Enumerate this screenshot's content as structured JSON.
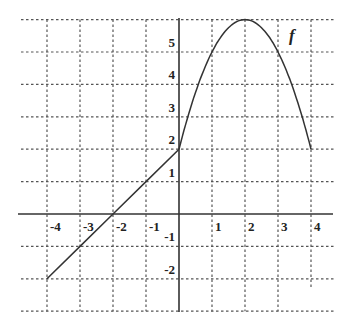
{
  "chart_data": {
    "type": "line",
    "title": "",
    "xlabel": "",
    "ylabel": "",
    "xlim": [
      -4,
      4
    ],
    "ylim": [
      -3,
      6
    ],
    "grid": true,
    "grid_style": "dashed",
    "x_ticks": [
      "-4",
      "-3",
      "-2",
      "-1",
      "1",
      "2",
      "3",
      "4"
    ],
    "y_ticks": [
      "-2",
      "-1",
      "1",
      "2",
      "3",
      "4",
      "5"
    ],
    "series": [
      {
        "name": "f",
        "piece": "linear",
        "formula": "f(x) = x + 2, -4 <= x <= 0",
        "x": [
          -4,
          -3,
          -2,
          -1,
          0
        ],
        "y": [
          -2,
          -1,
          0,
          1,
          2
        ]
      },
      {
        "name": "f",
        "piece": "parabola",
        "formula": "f(x) = 6 - (x - 2)^2, 0 <= x <= 4",
        "x": [
          0,
          1,
          2,
          3,
          4
        ],
        "y": [
          2,
          5,
          6,
          5,
          2
        ]
      }
    ],
    "annotations": [
      {
        "text": "f",
        "x": 3.4,
        "y": 5.5
      }
    ]
  },
  "labels": {
    "function_name": "f"
  }
}
